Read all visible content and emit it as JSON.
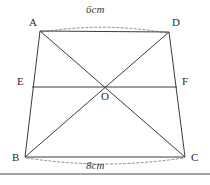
{
  "figure": {
    "kind": "geometry-diagram",
    "shape": "trapezoid",
    "background_color": "#ffffff",
    "stroke_color": "#3c3c3c",
    "dash_color": "#8a8a8a",
    "text_color": "#2b2b2b",
    "vertices": [
      {
        "id": "A",
        "label": "A",
        "x": 40,
        "y": 31
      },
      {
        "id": "D",
        "label": "D",
        "x": 169,
        "y": 32
      },
      {
        "id": "B",
        "label": "B",
        "x": 25,
        "y": 157
      },
      {
        "id": "C",
        "label": "C",
        "x": 185,
        "y": 157
      },
      {
        "id": "E",
        "label": "E",
        "x": 32,
        "y": 87
      },
      {
        "id": "F",
        "label": "F",
        "x": 177,
        "y": 87
      },
      {
        "id": "O",
        "label": "O",
        "x": 105,
        "y": 88
      }
    ],
    "segments": [
      {
        "name": "side-AD",
        "from": "A",
        "to": "D"
      },
      {
        "name": "side-AB",
        "from": "A",
        "to": "B"
      },
      {
        "name": "side-DC",
        "from": "D",
        "to": "C"
      },
      {
        "name": "side-BC",
        "from": "B",
        "to": "C"
      },
      {
        "name": "diagonal-AC",
        "from": "A",
        "to": "C"
      },
      {
        "name": "diagonal-BD",
        "from": "B",
        "to": "D"
      },
      {
        "name": "midline-EF",
        "from": "E",
        "to": "F"
      }
    ],
    "measurements": [
      {
        "name": "top-measure",
        "label": "6cm",
        "spans": "AD",
        "position": "above"
      },
      {
        "name": "bottom-measure",
        "label": "8cm",
        "spans": "BC",
        "position": "below"
      }
    ],
    "rule": {
      "name": "bottom-divider",
      "y": 174
    }
  }
}
